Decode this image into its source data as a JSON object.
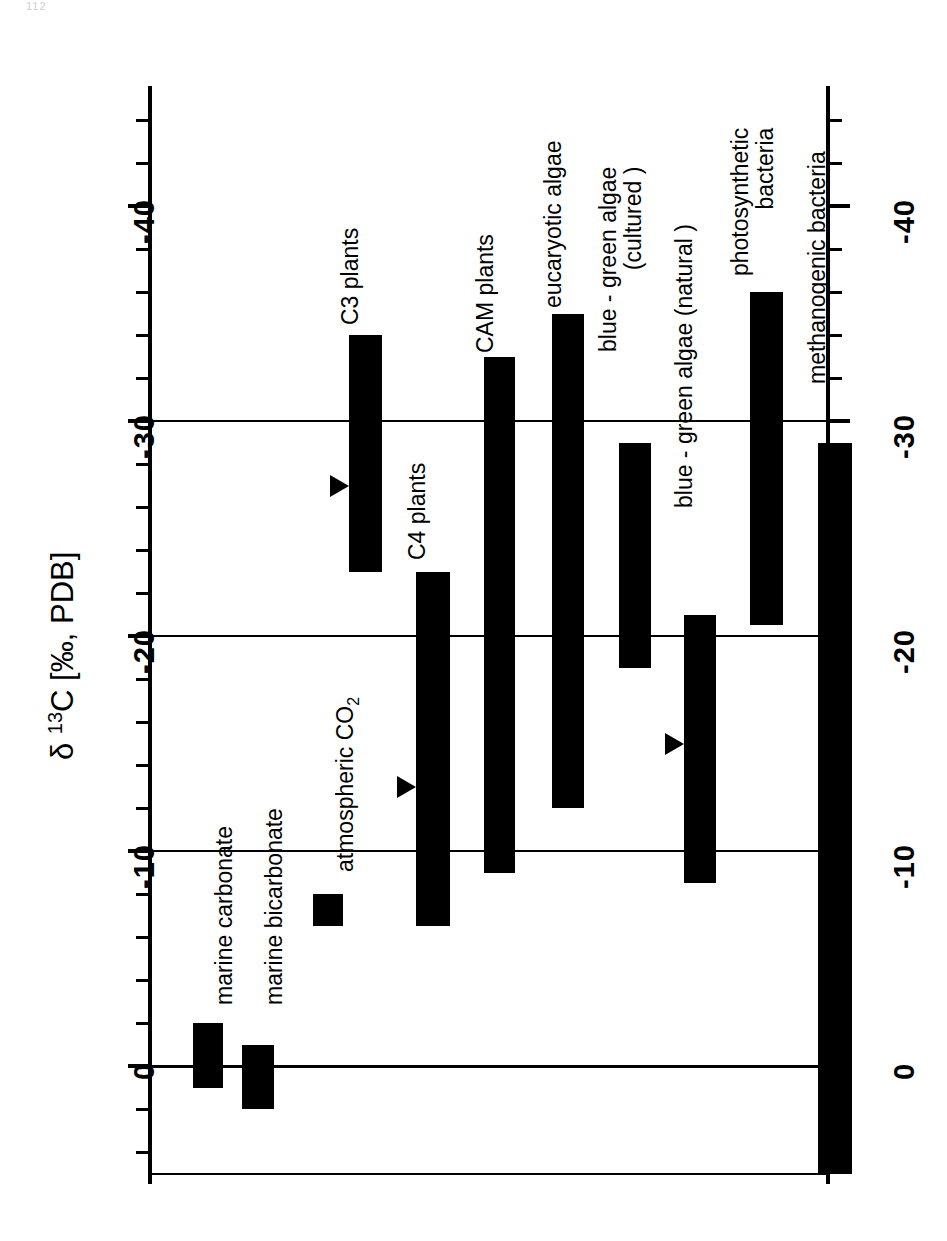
{
  "page": {
    "page_number_artifact": "112"
  },
  "chart_data": {
    "type": "bar",
    "orientation": "vertical-ranges",
    "title": "",
    "ylabel": "δ 13C [‰, PDB]",
    "ylabel_parts": {
      "symbol": "δ",
      "superscript": "13",
      "element": "C",
      "units": "[‰, PDB]"
    },
    "xlabel": "",
    "ylim": [
      5,
      -45
    ],
    "y_axis_inverted": true,
    "grid": true,
    "gridlines": [
      0,
      -10,
      -20,
      -30
    ],
    "major_ticks": [
      0,
      -10,
      -20,
      -30,
      -40
    ],
    "minor_tick_step": 2,
    "tick_labels": [
      "0",
      "-10",
      "-20",
      "-30",
      "-40"
    ],
    "axes_shown": [
      "left",
      "right"
    ],
    "legend": "none",
    "value_units": "per mil relative to PDB",
    "marker_note": "filled triangle = typical/mean value",
    "categories": [
      {
        "id": "marine-carbonate",
        "label": "marine  carbonate",
        "min": 1.0,
        "max": -2.0,
        "marker": null
      },
      {
        "id": "marine-bicarbonate",
        "label": "marine  bicarbonate",
        "min": 2.0,
        "max": -1.0,
        "marker": null
      },
      {
        "id": "atmospheric-co2",
        "label": "atmospheric  CO2",
        "label_base": "atmospheric  CO",
        "label_sub": "2",
        "min": -6.5,
        "max": -8.0,
        "marker": null
      },
      {
        "id": "c3-plants",
        "label": "C3 plants",
        "min": -23.0,
        "max": -34.0,
        "marker": -27.0
      },
      {
        "id": "c4-plants",
        "label": "C4 plants",
        "min": -6.5,
        "max": -23.0,
        "marker": -13.0
      },
      {
        "id": "cam-plants",
        "label": "CAM plants",
        "min": -9.0,
        "max": -33.0,
        "marker": null
      },
      {
        "id": "eucaryotic-algae",
        "label": "eucaryotic algae",
        "min": -12.0,
        "max": -35.0,
        "marker": null
      },
      {
        "id": "blue-green-algae-cultured",
        "label_line1": "blue - green algae",
        "label_line2": "(cultured )",
        "min": -18.5,
        "max": -29.0,
        "marker": null
      },
      {
        "id": "blue-green-algae-natural",
        "label": "blue - green algae (natural )",
        "min": -8.5,
        "max": -21.0,
        "marker": -15.0
      },
      {
        "id": "photosynthetic-bacteria",
        "label_line1": "photosynthetic",
        "label_line2": "bacteria",
        "min": -20.5,
        "max": -36.0,
        "marker": null
      },
      {
        "id": "methanogenic-bacteria",
        "label": "methanogenic bacteria",
        "min": 5.0,
        "max": -29.0,
        "marker": null
      }
    ]
  },
  "colors": {
    "bar": "#000000",
    "axis": "#000000",
    "background": "#ffffff"
  }
}
